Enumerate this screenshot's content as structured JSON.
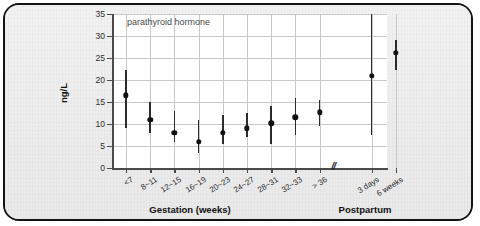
{
  "chart_data": {
    "type": "scatter",
    "title": "parathyroid hormone",
    "xlabel": "Gestation (weeks)",
    "xlabel_secondary": "Postpartum",
    "ylabel": "ng/L",
    "ylim": [
      0,
      35
    ],
    "ytick_labels": [
      "0",
      "5",
      "10",
      "15",
      "20",
      "25",
      "30",
      "35"
    ],
    "ytick_values": [
      0,
      5,
      10,
      15,
      20,
      25,
      30,
      35
    ],
    "grid": true,
    "legend": "none",
    "axis_break_marker": "//",
    "axis_break_note": "break between gestation and postpartum groups",
    "categories": [
      "<7",
      "8~11",
      "12~15",
      "16~19",
      "20~23",
      "24~27",
      "28~31",
      "32~33",
      "> 36",
      "3 days",
      "6 weeks"
    ],
    "group_of": [
      "Gestation (weeks)",
      "Gestation (weeks)",
      "Gestation (weeks)",
      "Gestation (weeks)",
      "Gestation (weeks)",
      "Gestation (weeks)",
      "Gestation (weeks)",
      "Gestation (weeks)",
      "Gestation (weeks)",
      "Postpartum",
      "Postpartum"
    ],
    "values": [
      16.5,
      11.0,
      8.0,
      6.0,
      8.0,
      9.0,
      10.2,
      11.5,
      12.7,
      21.0,
      26.2
    ],
    "error_low": [
      9.0,
      8.0,
      6.0,
      3.5,
      5.5,
      7.0,
      5.5,
      7.5,
      9.5,
      7.5,
      22.2
    ],
    "error_high": [
      22.2,
      15.0,
      13.0,
      11.0,
      12.0,
      12.5,
      14.0,
      16.0,
      15.5,
      35.0,
      29.0
    ],
    "series": [
      {
        "name": "parathyroid hormone",
        "values": [
          16.5,
          11.0,
          8.0,
          6.0,
          8.0,
          9.0,
          10.2,
          11.5,
          12.7,
          21.0,
          26.2
        ]
      }
    ],
    "marker_color": "#111111",
    "errorbar_color": "#2b2b2b",
    "grid_color": "#c9c9c9",
    "plot_background": "#ffffff",
    "figure_background": "#eeeeee"
  }
}
